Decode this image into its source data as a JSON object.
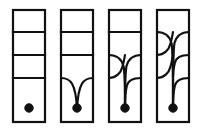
{
  "figure": {
    "type": "topological-strand-diagram",
    "width": 202,
    "height": 134,
    "background_color": "#ffffff",
    "ink_color": "#111111",
    "stroke_width": 2.2,
    "panel_count": 4
  },
  "geometry": {
    "panel_top": 10,
    "panel_bottom": 122,
    "panel_width": 32,
    "panel_lefts": [
      13,
      61,
      109,
      157
    ],
    "divider_ys": [
      32,
      55,
      78
    ],
    "dot_y": 108,
    "dot_radius": 4.4
  },
  "panels": [
    {
      "index": 1,
      "name": "panel-1",
      "label": "",
      "dividers_straight": 3,
      "dividers_pulled": 0,
      "crossings": 0,
      "dot": true
    },
    {
      "index": 2,
      "name": "panel-2",
      "label": "",
      "dividers_straight": 2,
      "dividers_pulled": 1,
      "crossings": 0,
      "dot": true
    },
    {
      "index": 3,
      "name": "panel-3",
      "label": "",
      "dividers_straight": 1,
      "dividers_pulled": 2,
      "crossings": 1,
      "dot": true
    },
    {
      "index": 4,
      "name": "panel-4",
      "label": "",
      "dividers_straight": 0,
      "dividers_pulled": 3,
      "crossings": 3,
      "dot": true
    }
  ],
  "chart_data": {
    "type": "line",
    "title": "",
    "xlabel": "",
    "ylabel": "",
    "categories": [
      "panel 1",
      "panel 2",
      "panel 3",
      "panel 4"
    ],
    "series": [
      {
        "name": "straight horizontal lines",
        "values": [
          3,
          2,
          1,
          0
        ]
      },
      {
        "name": "lines pulled to basepoint",
        "values": [
          0,
          1,
          2,
          3
        ]
      },
      {
        "name": "crossings",
        "values": [
          0,
          0,
          1,
          3
        ]
      }
    ]
  }
}
